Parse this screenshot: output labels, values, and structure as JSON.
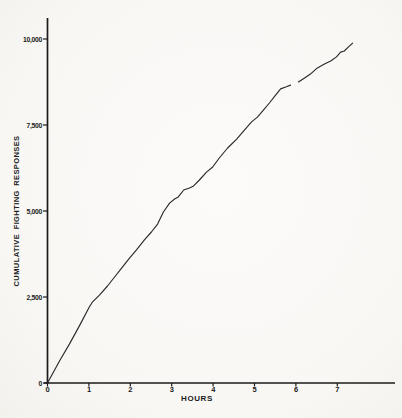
{
  "figure": {
    "background": "#f8f7f4",
    "ink": "#1b1b1b",
    "curve_color": "#2a2a2a"
  },
  "chart_data": {
    "type": "line",
    "title": "",
    "xlabel": "HOURS",
    "ylabel": "CUMULATIVE FIGHTING RESPONSES",
    "xlim": [
      0,
      8.4
    ],
    "ylim": [
      0,
      10600
    ],
    "grid": false,
    "legend": null,
    "x_ticks": [
      {
        "value": 0,
        "label": "0"
      },
      {
        "value": 1,
        "label": "1"
      },
      {
        "value": 2,
        "label": "2"
      },
      {
        "value": 3,
        "label": "3"
      },
      {
        "value": 4,
        "label": "4"
      },
      {
        "value": 5,
        "label": "5"
      },
      {
        "value": 6,
        "label": "6"
      },
      {
        "value": 7,
        "label": "7"
      }
    ],
    "y_ticks": [
      {
        "value": 0,
        "label": "0"
      },
      {
        "value": 2500,
        "label": "2,500"
      },
      {
        "value": 5000,
        "label": "5,000"
      },
      {
        "value": 7500,
        "label": "7,500"
      },
      {
        "value": 10000,
        "label": "10,000"
      }
    ],
    "series": [
      {
        "name": "cumulative-fighting-responses",
        "note": "cumulative record; null marks a pen-lift gap in the trace near hour 6",
        "points": [
          [
            0.0,
            0
          ],
          [
            0.29,
            640
          ],
          [
            0.53,
            1130
          ],
          [
            0.77,
            1660
          ],
          [
            1.01,
            2210
          ],
          [
            1.09,
            2360
          ],
          [
            1.26,
            2560
          ],
          [
            1.45,
            2820
          ],
          [
            1.62,
            3080
          ],
          [
            1.79,
            3340
          ],
          [
            1.98,
            3630
          ],
          [
            2.15,
            3870
          ],
          [
            2.34,
            4160
          ],
          [
            2.51,
            4390
          ],
          [
            2.66,
            4620
          ],
          [
            2.8,
            4970
          ],
          [
            2.95,
            5230
          ],
          [
            3.07,
            5350
          ],
          [
            3.16,
            5410
          ],
          [
            3.29,
            5610
          ],
          [
            3.43,
            5670
          ],
          [
            3.53,
            5730
          ],
          [
            3.67,
            5900
          ],
          [
            3.84,
            6130
          ],
          [
            3.99,
            6280
          ],
          [
            4.15,
            6540
          ],
          [
            4.35,
            6830
          ],
          [
            4.57,
            7090
          ],
          [
            4.76,
            7360
          ],
          [
            4.93,
            7590
          ],
          [
            5.07,
            7730
          ],
          [
            5.22,
            7940
          ],
          [
            5.36,
            8140
          ],
          [
            5.51,
            8370
          ],
          [
            5.63,
            8550
          ],
          [
            5.77,
            8610
          ],
          [
            5.87,
            8660
          ],
          null,
          [
            6.06,
            8750
          ],
          [
            6.21,
            8870
          ],
          [
            6.35,
            8980
          ],
          [
            6.52,
            9160
          ],
          [
            6.69,
            9270
          ],
          [
            6.84,
            9360
          ],
          [
            6.98,
            9480
          ],
          [
            7.08,
            9620
          ],
          [
            7.17,
            9650
          ],
          [
            7.27,
            9770
          ],
          [
            7.37,
            9880
          ]
        ]
      }
    ]
  }
}
